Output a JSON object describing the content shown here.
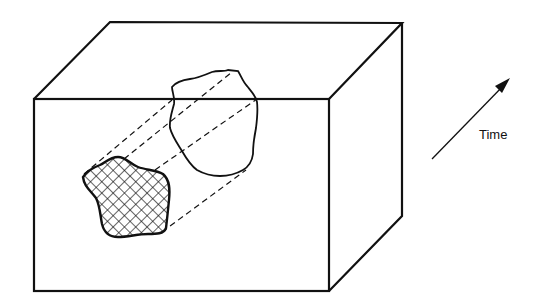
{
  "figure": {
    "time_label": "Time",
    "colors": {
      "stroke": "#111111",
      "background": "#ffffff"
    },
    "box": {
      "front": {
        "x1": 34,
        "y1": 99,
        "x2": 329,
        "y2": 291
      },
      "back_top_left": [
        110,
        22
      ],
      "back_top_right": [
        402,
        23
      ],
      "back_bottom_right": [
        402,
        216
      ]
    }
  }
}
